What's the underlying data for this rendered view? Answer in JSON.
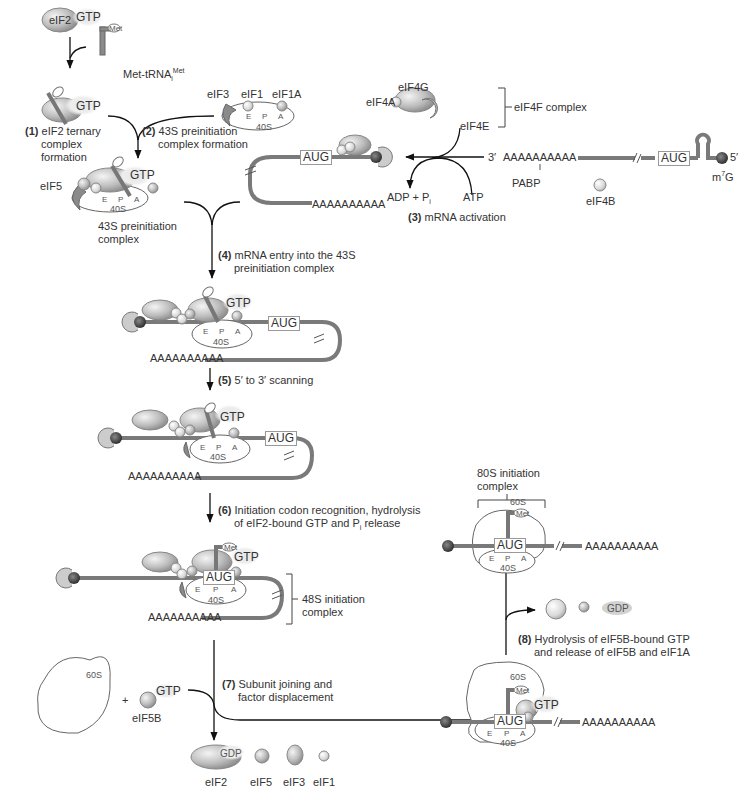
{
  "figure": {
    "colors": {
      "mrna": "#7a7a7a",
      "cap": "#333333",
      "factor_fill": "#c8c8c8",
      "factor_stroke": "#888888",
      "subunit_stroke": "#666666",
      "arrow": "#111111"
    }
  },
  "steps": [
    {
      "num": "(1)",
      "line1": "eIF2 ternary",
      "line2": "complex",
      "line3": "formation"
    },
    {
      "num": "(2)",
      "line1": "43S preinitiation",
      "line2": "complex formation"
    },
    {
      "num": "(3)",
      "line1": "mRNA activation"
    },
    {
      "num": "(4)",
      "line1": "mRNA entry into the 43S",
      "line2": "preinitiation complex"
    },
    {
      "num": "(5)",
      "line1": "5′ to 3′ scanning"
    },
    {
      "num": "(6)",
      "line1": "Initiation codon recognition, hydrolysis",
      "line2": "of eIF2-bound GTP and P",
      "line2_sub": "i",
      "line2_end": " release"
    },
    {
      "num": "(7)",
      "line1": "Subunit joining and",
      "line2": "factor displacement"
    },
    {
      "num": "(8)",
      "line1": "Hydrolysis of eIF5B-bound GTP",
      "line2": "and release of eIF5B and eIF1A"
    }
  ],
  "labels": {
    "eif2": "eIF2",
    "gtp": "GTP",
    "gdp": "GDP",
    "met": "Met",
    "met_trna": "Met-tRNA",
    "met_trna_sub": "i",
    "met_trna_sup": "Met",
    "eif3": "eIF3",
    "eif1": "eIF1",
    "eif1a": "eIF1A",
    "eif5": "eIF5",
    "eif4g": "eIF4G",
    "eif4a": "eIF4A",
    "eif4e": "eIF4E",
    "eif4f_complex": "eIF4F complex",
    "eif4b": "eIF4B",
    "eif5b": "eIF5B",
    "pabp": "PABP",
    "site_e": "E",
    "site_p": "P",
    "site_a": "A",
    "subunit_40s": "40S",
    "subunit_60s": "60S",
    "complex_43s_line1": "43S preinitiation",
    "complex_43s_line2": "complex",
    "complex_48s_line1": "48S initiation",
    "complex_48s_line2": "complex",
    "complex_80s_line1": "80S initiation",
    "complex_80s_line2": "complex",
    "aug": "AUG",
    "poly_a": "AAAAAAAAAA",
    "three_prime": "3′",
    "five_prime": "5′",
    "m7g": "m",
    "m7g_sup": "7",
    "m7g_end": "G",
    "adp": "ADP",
    "plus": "+",
    "pi": "P",
    "pi_sub": "i",
    "atp": "ATP"
  },
  "released_factors": [
    "eIF2",
    "eIF5",
    "eIF3",
    "eIF1"
  ]
}
